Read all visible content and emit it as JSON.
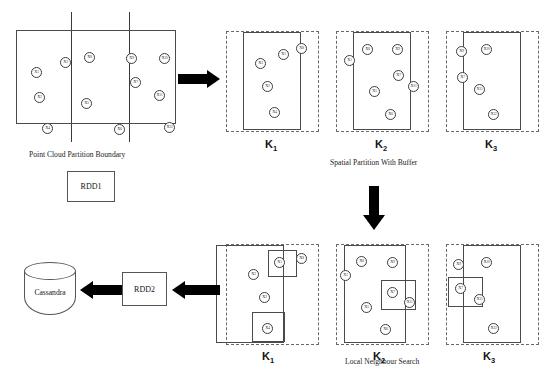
{
  "figure": {
    "captions": {
      "point_cloud": "Point Cloud Partition Boundary",
      "spatial_partition": "Spatial Partition With Buffer",
      "local_search": "Local Neighbour Search"
    },
    "nodes": {
      "rdd1": "RDD1",
      "rdd2": "RDD2",
      "cassandra": "Cassandra"
    },
    "partition_labels": {
      "k1": "K",
      "k1_sub": "1",
      "k2": "K",
      "k2_sub": "2",
      "k3": "K",
      "k3_sub": "3"
    },
    "colors": {
      "stroke": "#4a4a4a",
      "dashed_stroke": "#6a6a6a",
      "arrow": "#000000",
      "background": "#ffffff",
      "text": "#1a1a1a"
    }
  },
  "point_cloud": {
    "label_prefix": "X",
    "points": [
      {
        "id": "X1",
        "sub": "1",
        "x": 15,
        "y": 37
      },
      {
        "id": "X3",
        "sub": "3",
        "x": 44,
        "y": 27
      },
      {
        "id": "X8",
        "sub": "8",
        "x": 68,
        "y": 22
      },
      {
        "id": "X9",
        "sub": "9",
        "x": 110,
        "y": 23
      },
      {
        "id": "X10",
        "sub": "10",
        "x": 143,
        "y": 23
      },
      {
        "id": "X2",
        "sub": "2",
        "x": 18,
        "y": 62
      },
      {
        "id": "X7",
        "sub": "7",
        "x": 114,
        "y": 47
      },
      {
        "id": "X5",
        "sub": "5",
        "x": 65,
        "y": 68
      },
      {
        "id": "X11",
        "sub": "11",
        "x": 138,
        "y": 60
      },
      {
        "id": "X4",
        "sub": "4",
        "x": 26,
        "y": 93
      },
      {
        "id": "X6",
        "sub": "6",
        "x": 98,
        "y": 94
      },
      {
        "id": "X12",
        "sub": "12",
        "x": 148,
        "y": 92
      }
    ]
  },
  "spatial_partitions": [
    {
      "key": "k1",
      "points": [
        {
          "id": "X3",
          "sub": "3",
          "x": 29,
          "y": 27
        },
        {
          "id": "X1",
          "sub": "1",
          "x": 52,
          "y": 18
        },
        {
          "id": "X8",
          "sub": "8",
          "x": 70,
          "y": 12
        },
        {
          "id": "X2",
          "sub": "2",
          "x": 36,
          "y": 50
        },
        {
          "id": "X4",
          "sub": "4",
          "x": 43,
          "y": 76
        }
      ]
    },
    {
      "key": "k2",
      "points": [
        {
          "id": "X8",
          "sub": "8",
          "x": 26,
          "y": 13
        },
        {
          "id": "X9",
          "sub": "9",
          "x": 56,
          "y": 13
        },
        {
          "id": "X1",
          "sub": "1",
          "x": 8,
          "y": 24
        },
        {
          "id": "X7",
          "sub": "7",
          "x": 57,
          "y": 39
        },
        {
          "id": "X5",
          "sub": "5",
          "x": 33,
          "y": 55
        },
        {
          "id": "X11",
          "sub": "11",
          "x": 72,
          "y": 50
        },
        {
          "id": "X6",
          "sub": "6",
          "x": 49,
          "y": 78
        }
      ]
    },
    {
      "key": "k3",
      "points": [
        {
          "id": "X9",
          "sub": "9",
          "x": 10,
          "y": 15
        },
        {
          "id": "X10",
          "sub": "10",
          "x": 35,
          "y": 13
        },
        {
          "id": "X7",
          "sub": "7",
          "x": 11,
          "y": 41
        },
        {
          "id": "X11",
          "sub": "11",
          "x": 28,
          "y": 53
        },
        {
          "id": "X12",
          "sub": "12",
          "x": 42,
          "y": 78
        }
      ]
    }
  ],
  "neighbour_search": [
    {
      "key": "k1",
      "points": [
        {
          "id": "X1",
          "sub": "1",
          "x": 48,
          "y": 13
        },
        {
          "id": "X8",
          "sub": "8",
          "x": 70,
          "y": 9
        },
        {
          "id": "X3",
          "sub": "3",
          "x": 22,
          "y": 25
        },
        {
          "id": "X2",
          "sub": "2",
          "x": 33,
          "y": 48
        },
        {
          "id": "X4",
          "sub": "4",
          "x": 36,
          "y": 79
        }
      ],
      "boxes": [
        {
          "x": 42,
          "y": 6,
          "w": 29,
          "h": 27
        },
        {
          "x": 26,
          "y": 68,
          "w": 33,
          "h": 30
        }
      ]
    },
    {
      "key": "k2",
      "points": [
        {
          "id": "X8",
          "sub": "8",
          "x": 20,
          "y": 12
        },
        {
          "id": "X9",
          "sub": "9",
          "x": 51,
          "y": 13
        },
        {
          "id": "X1",
          "sub": "1",
          "x": 4,
          "y": 26
        },
        {
          "id": "X7",
          "sub": "7",
          "x": 51,
          "y": 43
        },
        {
          "id": "X11",
          "sub": "11",
          "x": 68,
          "y": 53
        },
        {
          "id": "X5",
          "sub": "5",
          "x": 25,
          "y": 58
        },
        {
          "id": "X6",
          "sub": "6",
          "x": 44,
          "y": 80
        }
      ],
      "boxes": [
        {
          "x": 45,
          "y": 36,
          "w": 35,
          "h": 30
        }
      ]
    },
    {
      "key": "k3",
      "points": [
        {
          "id": "X9",
          "sub": "9",
          "x": 7,
          "y": 15
        },
        {
          "id": "X10",
          "sub": "10",
          "x": 35,
          "y": 13
        },
        {
          "id": "X7",
          "sub": "7",
          "x": 9,
          "y": 39
        },
        {
          "id": "X11",
          "sub": "11",
          "x": 28,
          "y": 50
        },
        {
          "id": "X12",
          "sub": "12",
          "x": 42,
          "y": 79
        }
      ],
      "boxes": [
        {
          "x": 2,
          "y": 33,
          "w": 35,
          "h": 30
        }
      ]
    }
  ]
}
